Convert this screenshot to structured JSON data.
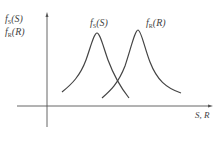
{
  "diagram": {
    "y_axis_label_1": "fS(S)",
    "y_axis_label_2": "fR(R)",
    "x_axis_label": "S, R",
    "curves": [
      {
        "name": "fS(S)",
        "label": "fS(S)",
        "peak": [
          97,
          33
        ]
      },
      {
        "name": "fR(R)",
        "label": "fR(R)",
        "peak": [
          138,
          30
        ]
      }
    ],
    "colors": {
      "line": "#444444",
      "axis": "#555555"
    }
  }
}
